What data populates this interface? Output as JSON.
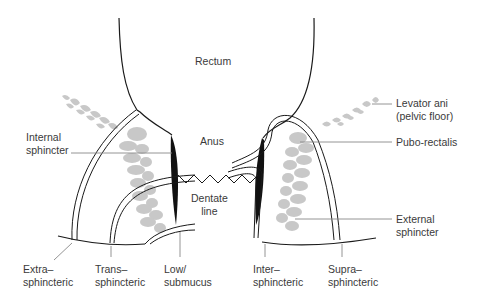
{
  "figure": {
    "type": "anatomical-diagram",
    "colors": {
      "outline": "#1a1a1a",
      "muscle": "#c8c8c8",
      "internal_sphincter": "#111111",
      "leader_line": "#888888",
      "text": "#3a3a3a",
      "background": "#ffffff"
    }
  },
  "labels": {
    "rectum": "Rectum",
    "anus": "Anus",
    "internal_sphincter": "Internal\nsphincter",
    "levator_ani": "Levator ani\n(pelvic floor)",
    "pubo_rectalis": "Pubo-rectalis",
    "dentate_line": "Dentate\nline",
    "external_sphincter": "External\nsphincter"
  },
  "fistula_types": [
    {
      "id": "extra",
      "label": "Extra–\nsphincteric"
    },
    {
      "id": "trans",
      "label": "Trans–\nsphincteric"
    },
    {
      "id": "low",
      "label": "Low/\nsubmucus"
    },
    {
      "id": "inter",
      "label": "Inter–\nsphincteric"
    },
    {
      "id": "supra",
      "label": "Supra–\nsphincteric"
    }
  ]
}
